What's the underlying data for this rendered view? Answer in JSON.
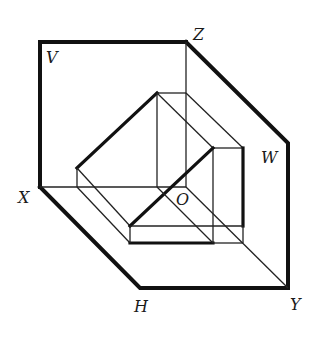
{
  "figure": {
    "type": "three-plane projection system with object",
    "labels": {
      "V": "V",
      "Z": "Z",
      "W": "W",
      "X": "X",
      "O": "O",
      "H": "H",
      "Y": "Y"
    },
    "colors": {
      "line": "#111111",
      "background": "#ffffff"
    }
  }
}
